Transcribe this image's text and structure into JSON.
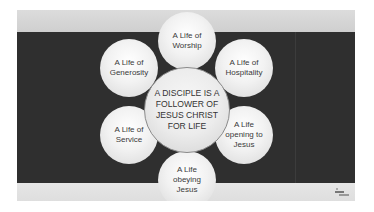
{
  "slide": {
    "colors": {
      "top_band": "#d6d6d6",
      "dark_band": "#2f2f2f",
      "bottom_band": "#e2e2e2",
      "circle_fill": "#f2f2f2",
      "text": "#3a3a3a"
    },
    "center": {
      "label": "A DISCIPLE IS A\nFOLLOWER OF\nJESUS CHRIST\nFOR LIFE"
    },
    "petals": [
      {
        "id": "worship",
        "label": "A Life of\nWorship"
      },
      {
        "id": "generosity",
        "label": "A Life of\nGenerosity"
      },
      {
        "id": "hospitality",
        "label": "A Life of\nHospitality"
      },
      {
        "id": "service",
        "label": "A Life of\nService"
      },
      {
        "id": "opening",
        "label": "A Life\nopening to\nJesus"
      },
      {
        "id": "obeying",
        "label": "A Life\nobeying\nJesus"
      }
    ],
    "logo_icon": "publisher-logo-icon"
  }
}
